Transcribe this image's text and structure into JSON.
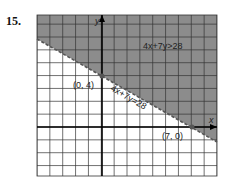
{
  "problem_number": "15.",
  "chart_data": {
    "type": "line",
    "title": "",
    "xlabel": "x",
    "ylabel": "y",
    "xlim": [
      -5,
      9
    ],
    "ylim": [
      -3.8,
      8.7
    ],
    "grid": true,
    "series": [
      {
        "name": "4x+7y=28",
        "style": "dashed",
        "x": [
          -5,
          9
        ],
        "y": [
          6.857,
          -1.143
        ]
      }
    ],
    "points": [
      {
        "label": "(0, 4)",
        "x": 0,
        "y": 4
      },
      {
        "label": "(7, 0)",
        "x": 7,
        "y": 0
      }
    ],
    "shaded_region": {
      "label": "4x+7y>28",
      "side": "above",
      "color": "#8c8c8c"
    },
    "annotations": [
      "4x+7y>28",
      "4x+7y=28",
      "(0, 4)",
      "(7, 0)"
    ]
  }
}
